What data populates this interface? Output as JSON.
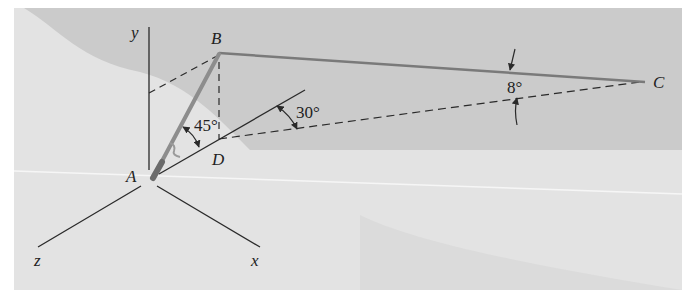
{
  "figure": {
    "type": "3D statics diagram (fishing rod with line)",
    "colors": {
      "frame_light": "#e2e2e2",
      "frame_dark": "#c9c9c9",
      "horizon": "#f4f4f4",
      "line": "#2a2a2a",
      "rope": "#7a7a7a",
      "rod": "#8d8d8d"
    }
  },
  "axes": {
    "x_label": "x",
    "y_label": "y",
    "z_label": "z"
  },
  "points": {
    "A": "A",
    "B": "B",
    "C": "C",
    "D": "D"
  },
  "angles": {
    "rod_elevation": "45°",
    "horizontal_angle": "30°",
    "line_angle": "8°"
  }
}
